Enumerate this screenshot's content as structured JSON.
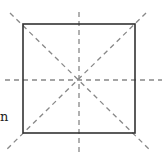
{
  "diagram": {
    "shape": "square",
    "square": {
      "x": 23,
      "y": 24,
      "width": 112,
      "height": 109
    },
    "center": {
      "x": 79,
      "y": 80
    },
    "symmetry_lines": [
      {
        "name": "vertical",
        "x1": 79,
        "y1": 12,
        "x2": 79,
        "y2": 153
      },
      {
        "name": "horizontal",
        "x1": 5,
        "y1": 80,
        "x2": 162,
        "y2": 80
      },
      {
        "name": "diagonal-main",
        "x1": 10,
        "y1": 13,
        "x2": 150,
        "y2": 150
      },
      {
        "name": "diagonal-anti",
        "x1": 146,
        "y1": 13,
        "x2": 6,
        "y2": 150
      }
    ],
    "line_count": 4,
    "colors": {
      "square_stroke": "#333333",
      "dashed_line": "#888888"
    },
    "partial_label": "n"
  }
}
